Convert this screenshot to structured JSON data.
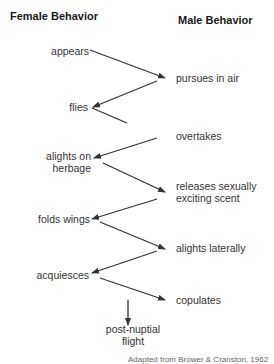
{
  "headers": {
    "female": "Female Behavior",
    "male": "Male Behavior"
  },
  "female_steps": [
    {
      "lines": [
        "appears"
      ]
    },
    {
      "lines": [
        "flies"
      ]
    },
    {
      "lines": [
        "alights on",
        "herbage"
      ]
    },
    {
      "lines": [
        "folds wings"
      ]
    },
    {
      "lines": [
        "acquiesces"
      ]
    }
  ],
  "male_steps": [
    {
      "lines": [
        "pursues in air"
      ]
    },
    {
      "lines": [
        "overtakes"
      ]
    },
    {
      "lines": [
        "releases sexually",
        "exciting scent"
      ]
    },
    {
      "lines": [
        "alights laterally"
      ]
    },
    {
      "lines": [
        "copulates"
      ]
    }
  ],
  "final_step": {
    "lines": [
      "post-nuptial",
      "flight"
    ]
  },
  "caption": "Adapted from Brower & Cranston, 1962",
  "colors": {
    "arrow": "#333333",
    "text": "#333333"
  }
}
